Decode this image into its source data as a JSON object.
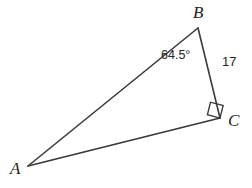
{
  "figure": {
    "type": "right-triangle-geometry-diagram",
    "background_color": "#ffffff",
    "stroke_color": "#3a3a3c",
    "text_color": "#231f20",
    "vertices": {
      "A": {
        "label": "A",
        "x": 28,
        "y": 166
      },
      "B": {
        "label": "B",
        "x": 198,
        "y": 28
      },
      "C": {
        "label": "C",
        "x": 220,
        "y": 118
      }
    },
    "sides": [
      {
        "name": "AB",
        "from": "A",
        "to": "B",
        "label": ""
      },
      {
        "name": "BC",
        "from": "B",
        "to": "C",
        "label": "17"
      },
      {
        "name": "AC",
        "from": "A",
        "to": "C",
        "label": ""
      }
    ],
    "angles": [
      {
        "at": "B",
        "label": "64.5°",
        "value": 64.5,
        "unit": "degrees"
      },
      {
        "at": "C",
        "label": "",
        "value": 90,
        "unit": "degrees",
        "marker": "right-angle-square"
      }
    ],
    "right_angle_marker": {
      "vertex": "C",
      "size": 12,
      "rotation_deg": -14
    }
  }
}
